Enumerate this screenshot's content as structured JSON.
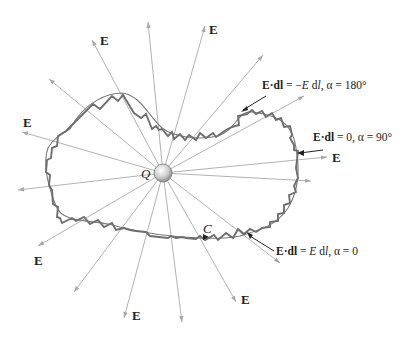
{
  "figure": {
    "charge_label": "Q",
    "curve_label": "C",
    "field_label": "E",
    "annotations": {
      "antiparallel": {
        "lhs_bold": "E·dl",
        "rhs_pre": " = −",
        "rhs_var": "E",
        "rhs_mid": " d",
        "rhs_l": "l",
        "rhs_post": ", α = 180°"
      },
      "perpendicular": {
        "lhs_bold": "E·dl",
        "rhs": " = 0, α = 90°"
      },
      "parallel": {
        "lhs_bold": "E·dl",
        "rhs_pre": " = ",
        "rhs_var": "E",
        "rhs_mid": " d",
        "rhs_l": "l",
        "rhs_post": ", α = 0"
      }
    },
    "colors": {
      "field_lines": "#a8a8a8",
      "path": "#6e6e6e",
      "charge_fill": "#d9d9d9",
      "text": "#222222"
    }
  }
}
